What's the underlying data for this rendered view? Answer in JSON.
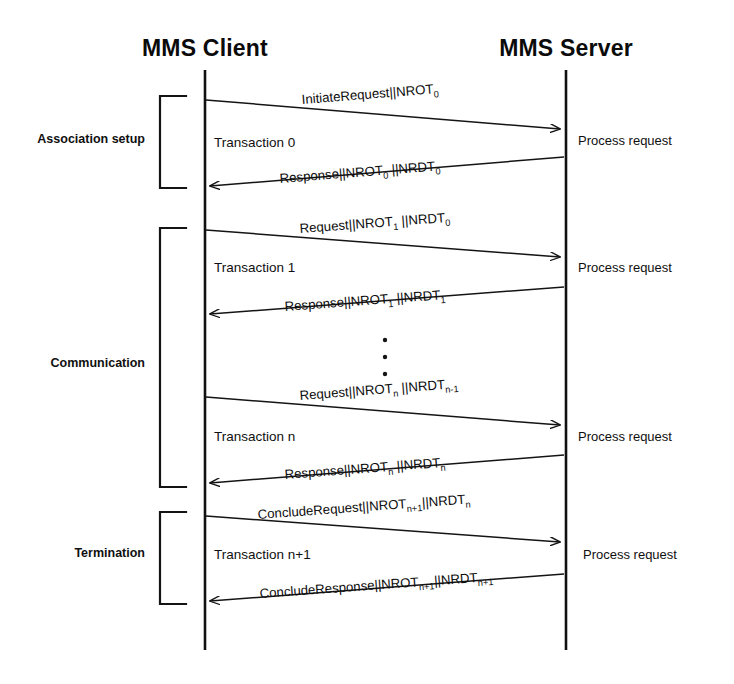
{
  "diagram": {
    "type": "sequence-diagram",
    "background": "#ffffff",
    "ink_color": "#111111",
    "lifelines": [
      {
        "id": "client",
        "title": "MMS Client",
        "x": 205,
        "top": 70,
        "bottom": 650
      },
      {
        "id": "server",
        "title": "MMS Server",
        "x": 566,
        "top": 70,
        "bottom": 650
      }
    ],
    "phases": [
      {
        "id": "association-setup",
        "label": "Association setup",
        "label_x": 78,
        "label_y": 143,
        "bracket_top": 96,
        "bracket_bottom": 188,
        "bracket_x": 160,
        "bracket_w": 26
      },
      {
        "id": "communication",
        "label": "Communication",
        "label_x": 78,
        "label_y": 367,
        "bracket_top": 228,
        "bracket_bottom": 487,
        "bracket_x": 160,
        "bracket_w": 26
      },
      {
        "id": "termination",
        "label": "Termination",
        "label_x": 78,
        "label_y": 557,
        "bracket_top": 512,
        "bracket_bottom": 604,
        "bracket_x": 160,
        "bracket_w": 26
      }
    ],
    "transactions": [
      {
        "id": "transaction-0",
        "label": "Transaction 0",
        "label_x": 214,
        "label_y": 147,
        "request": {
          "text_parts": [
            {
              "t": "InitiateRequest||NROT",
              "sub": false
            },
            {
              "t": "0",
              "sub": true
            }
          ],
          "plain": "InitiateRequest||NROT0",
          "x1": 206,
          "y1": 100,
          "x2": 564,
          "y2": 129,
          "label_x": 302,
          "label_y": 104,
          "rotate": -4.6,
          "direction": "client-to-server"
        },
        "response": {
          "text_parts": [
            {
              "t": "Response||NROT",
              "sub": false
            },
            {
              "t": "0",
              "sub": true
            },
            {
              "t": " ||NRDT",
              "sub": false
            },
            {
              "t": "0",
              "sub": true
            }
          ],
          "plain": "Response||NROT0 ||NRDT0",
          "x1": 564,
          "y1": 157,
          "x2": 206,
          "y2": 186,
          "label_x": 280,
          "label_y": 183,
          "rotate": -4.6,
          "direction": "server-to-client"
        }
      },
      {
        "id": "transaction-1",
        "label": "Transaction 1",
        "label_x": 214,
        "label_y": 272,
        "request": {
          "text_parts": [
            {
              "t": "Request||NROT",
              "sub": false
            },
            {
              "t": "1",
              "sub": true
            },
            {
              "t": " ||NRDT",
              "sub": false
            },
            {
              "t": "0",
              "sub": true
            }
          ],
          "plain": "Request||NROT1 ||NRDT0",
          "x1": 206,
          "y1": 230,
          "x2": 564,
          "y2": 257,
          "label_x": 300,
          "label_y": 232,
          "rotate": -4.3,
          "direction": "client-to-server"
        },
        "response": {
          "text_parts": [
            {
              "t": "Response||NROT",
              "sub": false
            },
            {
              "t": "1",
              "sub": true
            },
            {
              "t": " ||NRDT",
              "sub": false
            },
            {
              "t": "1",
              "sub": true
            }
          ],
          "plain": "Response||NROT1 ||NRDT1",
          "x1": 564,
          "y1": 287,
          "x2": 206,
          "y2": 314,
          "label_x": 285,
          "label_y": 311,
          "rotate": -4.3,
          "direction": "server-to-client"
        }
      },
      {
        "id": "transaction-n",
        "label": "Transaction n",
        "label_x": 214,
        "label_y": 441,
        "request": {
          "text_parts": [
            {
              "t": "Request||NROT",
              "sub": false
            },
            {
              "t": "n",
              "sub": true
            },
            {
              "t": " ||NRDT",
              "sub": false
            },
            {
              "t": "n-1",
              "sub": true
            }
          ],
          "plain": "Request||NROTn ||NRDTn-1",
          "x1": 206,
          "y1": 397,
          "x2": 564,
          "y2": 425,
          "label_x": 300,
          "label_y": 400,
          "rotate": -4.4,
          "direction": "client-to-server"
        },
        "response": {
          "text_parts": [
            {
              "t": "Response||NROT",
              "sub": false
            },
            {
              "t": "n",
              "sub": true
            },
            {
              "t": " ||NRDT",
              "sub": false
            },
            {
              "t": "n",
              "sub": true
            }
          ],
          "plain": "Response||NROTn ||NRDTn",
          "x1": 564,
          "y1": 455,
          "x2": 206,
          "y2": 483,
          "label_x": 285,
          "label_y": 479,
          "rotate": -4.4,
          "direction": "server-to-client"
        }
      },
      {
        "id": "transaction-n-plus-1",
        "label": "Transaction n+1",
        "label_x": 214,
        "label_y": 559,
        "request": {
          "text_parts": [
            {
              "t": "ConcludeRequest||NROT",
              "sub": false
            },
            {
              "t": "n+1",
              "sub": true
            },
            {
              "t": "||NRDT",
              "sub": false
            },
            {
              "t": "n",
              "sub": true
            }
          ],
          "plain": "ConcludeRequest||NROTn+1||NRDTn",
          "x1": 206,
          "y1": 516,
          "x2": 564,
          "y2": 542,
          "label_x": 258,
          "label_y": 518,
          "rotate": -4.2,
          "direction": "client-to-server"
        },
        "response": {
          "text_parts": [
            {
              "t": "ConcludeResponse||NROT",
              "sub": false
            },
            {
              "t": "n+1",
              "sub": true
            },
            {
              "t": "||NRDT",
              "sub": false
            },
            {
              "t": "n+1",
              "sub": true
            }
          ],
          "plain": "ConcludeResponse||NROTn+1||NRDTn+1",
          "x1": 564,
          "y1": 574,
          "x2": 206,
          "y2": 601,
          "label_x": 260,
          "label_y": 598,
          "rotate": -4.2,
          "direction": "server-to-client"
        }
      }
    ],
    "server_notes": [
      {
        "id": "process-request-0",
        "label": "Process request",
        "x": 578,
        "y": 145
      },
      {
        "id": "process-request-1",
        "label": "Process request",
        "x": 578,
        "y": 272
      },
      {
        "id": "process-request-n",
        "label": "Process request",
        "x": 578,
        "y": 441
      },
      {
        "id": "process-request-n-plus-1",
        "label": "Process request",
        "x": 583,
        "y": 559
      }
    ],
    "ellipsis": {
      "id": "continuation-ellipsis",
      "x": 385,
      "dots_y": [
        340,
        357,
        374
      ],
      "radius": 2.2
    }
  }
}
